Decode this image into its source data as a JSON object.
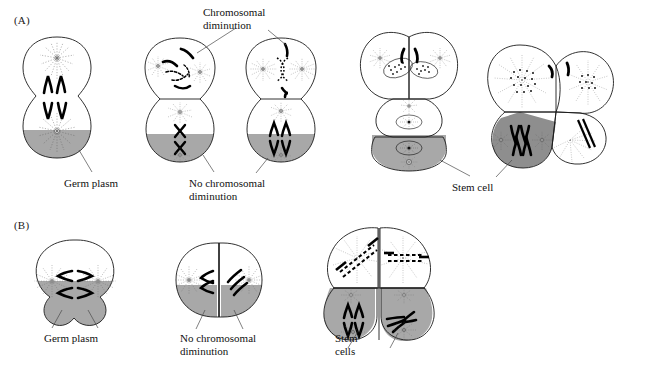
{
  "figure": {
    "title_implicit": "Chromosomal diminution in Ascaris embryos",
    "background_color": "#ffffff",
    "germ_plasm_color": "#a8a8a8",
    "stem_cell_color": "#8e8e8e",
    "outline_color": "#1b1b1b",
    "chromosome_color": "#000000",
    "leader_color": "#4a4a4a"
  },
  "panels": [
    {
      "id": "A",
      "letter": "(A)",
      "letter_pos": {
        "x": 14,
        "y": 14
      },
      "description": "Vertical (anterior-posterior) cleavage series showing chromosomal diminution in somatic cells and retention of intact chromosomes in germ-plasm-containing cells"
    },
    {
      "id": "B",
      "letter": "(B)",
      "letter_pos": {
        "x": 14,
        "y": 219
      },
      "description": "Horizontal cleavage series in which germ plasm is divided between both daughter cells so neither undergoes diminution"
    }
  ],
  "labels": [
    {
      "name": "chromosomal-diminution-label",
      "text": "Chromosomal\ndiminution",
      "panel": "A",
      "x": 203,
      "y": 8,
      "width": 110,
      "align": "left"
    },
    {
      "name": "germ-plasm-label-a",
      "text": "Germ plasm",
      "panel": "A",
      "x": 64,
      "y": 178,
      "width": 80,
      "align": "left"
    },
    {
      "name": "no-chromosomal-diminution-label-a",
      "text": "No chromosomal\ndiminution",
      "panel": "A",
      "x": 189,
      "y": 178,
      "width": 100,
      "align": "left"
    },
    {
      "name": "stem-cell-label",
      "text": "Stem cell",
      "panel": "A",
      "x": 452,
      "y": 178,
      "width": 70,
      "align": "left"
    },
    {
      "name": "germ-plasm-label-b",
      "text": "Germ plasm",
      "panel": "B",
      "x": 44,
      "y": 333,
      "width": 80,
      "align": "left"
    },
    {
      "name": "no-chromosomal-diminution-label-b",
      "text": "No chromosomal\ndiminution",
      "panel": "B",
      "x": 180,
      "y": 333,
      "width": 100,
      "align": "left"
    },
    {
      "name": "stem-cells-label",
      "text": "Stem\ncells",
      "panel": "B",
      "x": 335,
      "y": 333,
      "width": 50,
      "align": "left"
    }
  ],
  "stages": {
    "panel_a": [
      {
        "name": "stage-a1-dividing-zygote",
        "caption": "Dividing cell with germ plasm at vegetal pole, chromosomes separating toward two asters",
        "has_germ_plasm": true,
        "diminution": false
      },
      {
        "name": "stage-a2-two-cell-diminution",
        "caption": "Two-cell stage: upper somatic cell chromosomes fragmenting (diminution); lower germ-plasm cell retains intact X chromosomes",
        "has_germ_plasm": true,
        "diminution": true
      },
      {
        "name": "stage-a3-two-cell-post-diminution",
        "caption": "Upper cell with diminished chromatin distributed to two asters; lower germ-plasm cell dividing with intact chromosomes",
        "has_germ_plasm": true,
        "diminution": true
      },
      {
        "name": "stage-a4-four-cell-cluster",
        "caption": "Four-cell cluster: two somatic cells with diminished nuclei, one mid cell, one gray stem cell with germ plasm",
        "has_germ_plasm": true,
        "diminution": true
      },
      {
        "name": "stage-a5-four-cell-stem-cell",
        "caption": "Later cluster: somatic cells with diminished chromatin, gray stem cell retaining full chromosome complement",
        "has_germ_plasm": true,
        "diminution": true
      }
    ],
    "panel_b": [
      {
        "name": "stage-b1-horizontal-division",
        "caption": "Cell dividing on a vertical plane so that germ plasm is split between both daughters",
        "has_germ_plasm": true,
        "diminution": false
      },
      {
        "name": "stage-b2-two-cell-both-germ-plasm",
        "caption": "Two-cell stage in which both cells contain germ plasm and neither shows diminution",
        "has_germ_plasm": true,
        "diminution": false
      },
      {
        "name": "stage-b3-four-cell-two-stem-cells",
        "caption": "Four-cell stage: two upper somatic cells with diminished chromatin, two lower gray stem cells with germ plasm",
        "has_germ_plasm": true,
        "diminution": true
      }
    ]
  }
}
